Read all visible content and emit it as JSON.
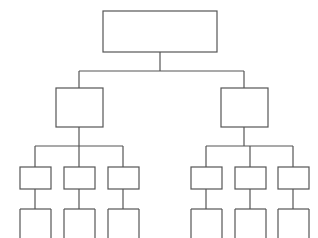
{
  "diagram": {
    "type": "tree-hierarchy",
    "orientation": "top-down",
    "background_color": "#ffffff",
    "stroke_color": "#555555",
    "node_fill_color": "#ffffff",
    "stroke_width": 1.2,
    "levels": 4,
    "total_nodes": 9,
    "total_leaf_stems": 12,
    "canvas": {
      "width": 318,
      "height": 238
    }
  },
  "nodes": {
    "root": {
      "id": "root",
      "label": "",
      "level": 0,
      "x": 103,
      "y": 11,
      "width": 114,
      "height": 41,
      "center_x": 160
    },
    "level2": [
      {
        "id": "l2-left",
        "label": "",
        "level": 1,
        "x": 56,
        "y": 88,
        "width": 47,
        "height": 39,
        "center_x": 79
      },
      {
        "id": "l2-right",
        "label": "",
        "level": 1,
        "x": 221,
        "y": 88,
        "width": 47,
        "height": 39,
        "center_x": 244
      }
    ],
    "level3": [
      {
        "id": "l3-a",
        "label": "",
        "level": 2,
        "x": 20,
        "y": 167,
        "width": 31,
        "height": 22,
        "center_x": 35,
        "parent": "l2-left"
      },
      {
        "id": "l3-b",
        "label": "",
        "level": 2,
        "x": 64,
        "y": 167,
        "width": 31,
        "height": 22,
        "center_x": 79,
        "parent": "l2-left"
      },
      {
        "id": "l3-c",
        "label": "",
        "level": 2,
        "x": 108,
        "y": 167,
        "width": 31,
        "height": 22,
        "center_x": 123,
        "parent": "l2-left"
      },
      {
        "id": "l3-d",
        "label": "",
        "level": 2,
        "x": 191,
        "y": 167,
        "width": 31,
        "height": 22,
        "center_x": 206,
        "parent": "l2-right"
      },
      {
        "id": "l3-e",
        "label": "",
        "level": 2,
        "x": 235,
        "y": 167,
        "width": 31,
        "height": 22,
        "center_x": 250,
        "parent": "l2-right"
      },
      {
        "id": "l3-f",
        "label": "",
        "level": 2,
        "x": 278,
        "y": 167,
        "width": 31,
        "height": 22,
        "center_x": 293,
        "parent": "l2-right"
      }
    ],
    "level4_stems": [
      {
        "id": "l4-a",
        "label": "",
        "level": 3,
        "parent": "l3-a",
        "bar_y": 209,
        "bar_left": 20,
        "bar_right": 51,
        "leg_bottom": 238
      },
      {
        "id": "l4-b",
        "label": "",
        "level": 3,
        "parent": "l3-b",
        "bar_y": 209,
        "bar_left": 64,
        "bar_right": 95,
        "leg_bottom": 238
      },
      {
        "id": "l4-c",
        "label": "",
        "level": 3,
        "parent": "l3-c",
        "bar_y": 209,
        "bar_left": 108,
        "bar_right": 139,
        "leg_bottom": 238
      },
      {
        "id": "l4-d",
        "label": "",
        "level": 3,
        "parent": "l3-d",
        "bar_y": 209,
        "bar_left": 191,
        "bar_right": 222,
        "leg_bottom": 238
      },
      {
        "id": "l4-e",
        "label": "",
        "level": 3,
        "parent": "l3-e",
        "bar_y": 209,
        "bar_left": 235,
        "bar_right": 266,
        "leg_bottom": 238
      },
      {
        "id": "l4-f",
        "label": "",
        "level": 3,
        "parent": "l3-f",
        "bar_y": 209,
        "bar_left": 278,
        "bar_right": 309,
        "leg_bottom": 238
      }
    ]
  },
  "connectors": {
    "root_drop": {
      "x": 160,
      "y1": 52,
      "y2": 71
    },
    "level2_bus": {
      "y": 71,
      "x1": 79,
      "x2": 244
    },
    "level2_risers": [
      {
        "x": 79,
        "y1": 71,
        "y2": 88
      },
      {
        "x": 244,
        "y1": 71,
        "y2": 88
      }
    ],
    "level2_drops": [
      {
        "x": 79,
        "y1": 127,
        "y2": 146
      },
      {
        "x": 244,
        "y1": 127,
        "y2": 146
      }
    ],
    "level3_buses": [
      {
        "y": 146,
        "x1": 35,
        "x2": 123
      },
      {
        "y": 146,
        "x1": 206,
        "x2": 293
      }
    ],
    "level3_risers": [
      {
        "x": 35,
        "y1": 146,
        "y2": 167
      },
      {
        "x": 79,
        "y1": 146,
        "y2": 167
      },
      {
        "x": 123,
        "y1": 146,
        "y2": 167
      },
      {
        "x": 206,
        "y1": 146,
        "y2": 167
      },
      {
        "x": 250,
        "y1": 146,
        "y2": 167
      },
      {
        "x": 293,
        "y1": 146,
        "y2": 167
      }
    ],
    "level4_drops": [
      {
        "x": 35,
        "y1": 189,
        "y2": 209
      },
      {
        "x": 79,
        "y1": 189,
        "y2": 209
      },
      {
        "x": 123,
        "y1": 189,
        "y2": 209
      },
      {
        "x": 206,
        "y1": 189,
        "y2": 209
      },
      {
        "x": 250,
        "y1": 189,
        "y2": 209
      },
      {
        "x": 293,
        "y1": 189,
        "y2": 209
      }
    ]
  }
}
